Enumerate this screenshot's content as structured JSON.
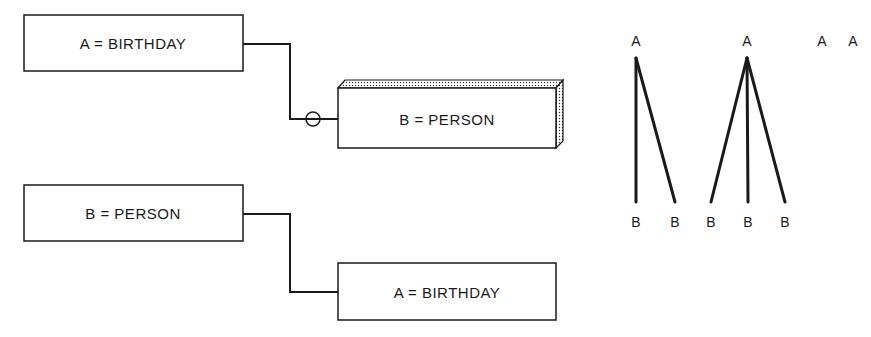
{
  "diagram": {
    "boxes": [
      {
        "id": "box1",
        "label": "A = BIRTHDAY"
      },
      {
        "id": "box2",
        "label": "B = PERSON",
        "style": "3d-shaded"
      },
      {
        "id": "box3",
        "label": "B = PERSON"
      },
      {
        "id": "box4",
        "label": "A = BIRTHDAY"
      }
    ],
    "connectors": [
      {
        "from": "box1",
        "to": "box2",
        "marker": "circle"
      },
      {
        "from": "box3",
        "to": "box4",
        "marker": "none"
      }
    ],
    "trees": {
      "top_labels": [
        "A",
        "A",
        "A",
        "A"
      ],
      "bottom_labels": [
        "B",
        "B",
        "B",
        "B",
        "B"
      ]
    }
  },
  "colors": {
    "stroke": "#1a1a1a",
    "background": "#ffffff"
  }
}
